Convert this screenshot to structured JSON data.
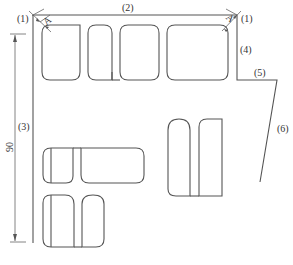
{
  "diagram": {
    "type": "floor-plan-layout",
    "labels": {
      "l1_left": "(1)",
      "l1_right": "(1)",
      "l2": "(2)",
      "l3": "(3)",
      "l4": "(4)",
      "l5": "(5)",
      "l6": "(6)",
      "dim_90": "90",
      "clearance_a_left": "A",
      "clearance_a_right": "A"
    },
    "boundary_segments": [
      "(1) corner",
      "(2) top edge",
      "(3) left edge",
      "(4) right upper edge",
      "(5) step edge",
      "(6) diagonal edge"
    ],
    "shape_groups": [
      {
        "name": "top-row",
        "count": 4
      },
      {
        "name": "right-pair",
        "count": 2
      },
      {
        "name": "bottom-left-row-1",
        "count": 2
      },
      {
        "name": "bottom-left-row-2",
        "count": 2
      }
    ],
    "colors": {
      "line": "#555555",
      "text": "#333333",
      "background": "#ffffff"
    }
  }
}
